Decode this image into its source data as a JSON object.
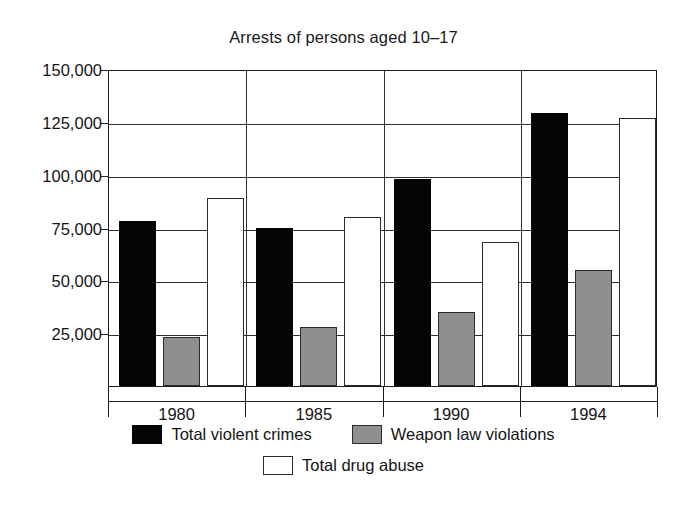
{
  "chart_data": {
    "type": "bar",
    "title": "Arrests of persons aged 10–17",
    "xlabel": "",
    "ylabel": "",
    "categories": [
      "1980",
      "1985",
      "1990",
      "1994"
    ],
    "series": [
      {
        "name": "Total violent crimes",
        "color": "#050505",
        "values": [
          78000,
          75000,
          98000,
          129000
        ]
      },
      {
        "name": "Weapon law violations",
        "color": "#8f8f8f",
        "values": [
          23000,
          28000,
          35000,
          55000
        ]
      },
      {
        "name": "Total drug abuse",
        "color": "#ffffff",
        "values": [
          89000,
          80000,
          68000,
          127000
        ]
      }
    ],
    "ylim": [
      0,
      150000
    ],
    "y_ticks": [
      150000,
      125000,
      100000,
      75000,
      50000,
      25000
    ],
    "y_tick_labels": [
      "150,000",
      "125,000",
      "100,000",
      "75,000",
      "50,000",
      "25,000"
    ],
    "grid": true,
    "legend_position": "bottom"
  },
  "legend": {
    "rows": [
      [
        {
          "label": "Total violent crimes",
          "swatch": "violent",
          "icon": "black-square-swatch"
        },
        {
          "label": "Weapon law violations",
          "swatch": "weapon",
          "icon": "gray-square-swatch"
        }
      ],
      [
        {
          "label": "Total drug abuse",
          "swatch": "drug",
          "icon": "white-square-swatch"
        }
      ]
    ]
  }
}
